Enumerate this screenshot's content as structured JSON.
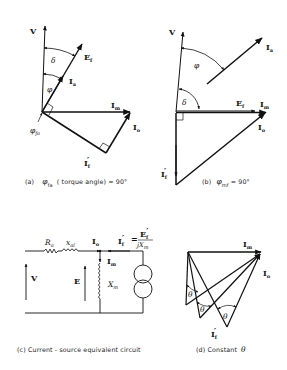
{
  "figure": {
    "panels": [
      {
        "id": "a",
        "caption_prefix": "(a)",
        "caption_symbol": "φ",
        "caption_symbol_sub": "fa",
        "caption_text": "( torque angle) = 90°",
        "labels": {
          "V": "V",
          "Ef": "E",
          "Ef_sub": "f",
          "Ia": "I",
          "Ia_sub": "a",
          "Im": "I",
          "Im_sub": "m",
          "Io": "I",
          "Io_sub": "o",
          "If": "I",
          "If_sub": "f",
          "If_prime": "′",
          "delta": "δ",
          "phi": "φ",
          "phi_fa": "φ",
          "phi_fa_sub": "fa"
        }
      },
      {
        "id": "b",
        "caption_prefix": "(b)",
        "caption_symbol": "φ",
        "caption_symbol_sub": "mf",
        "caption_text": "= 90°",
        "labels": {
          "V": "V",
          "Ia": "I",
          "Ia_sub": "a",
          "phi": "φ",
          "delta": "δ",
          "Ef": "E",
          "Ef_sub": "f",
          "Im": "I",
          "Im_sub": "m",
          "Io": "I",
          "Io_sub": "o",
          "If": "I",
          "If_sub": "f",
          "If_prime": "′"
        }
      },
      {
        "id": "c",
        "caption": "(c) Current - source equivalent circuit",
        "labels": {
          "Ra": "R",
          "Ra_sub": "a",
          "xal": "x",
          "xal_sub": "al",
          "Ia": "I",
          "Ia_sub": "o",
          "If_eq_lhs": "I",
          "If_eq_sub": "f",
          "If_eq_prime": "′",
          "eq": "=",
          "num": "E",
          "num_sub": "f",
          "num_prime": "′",
          "den": "jX",
          "den_sub": "m",
          "Im": "I",
          "Im_sub": "m",
          "V": "V",
          "E": "E",
          "Xm": "X",
          "Xm_sub": "m"
        }
      },
      {
        "id": "d",
        "caption_prefix": "(d) Constant",
        "caption_symbol": "θ",
        "labels": {
          "Im": "I",
          "Im_sub": "m",
          "Io": "I",
          "Io_sub": "o",
          "If": "I",
          "If_sub": "f",
          "If_prime": "′",
          "theta": "θ"
        }
      }
    ]
  }
}
